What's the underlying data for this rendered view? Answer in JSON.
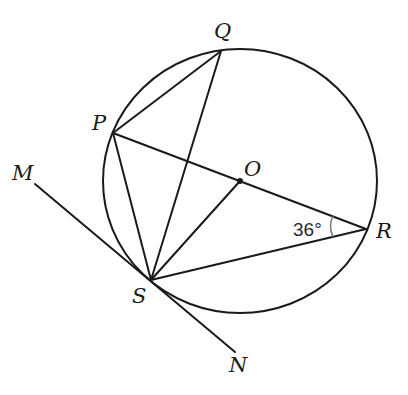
{
  "diagram": {
    "type": "circle-geometry",
    "circle": {
      "center_label": "O",
      "cx": 240,
      "cy": 181,
      "rx": 137,
      "ry": 132
    },
    "points": {
      "Q": {
        "label": "Q",
        "x": 221,
        "y": 51
      },
      "P": {
        "label": "P",
        "x": 113,
        "y": 133
      },
      "O": {
        "label": "O",
        "x": 240,
        "y": 181
      },
      "R": {
        "label": "R",
        "x": 366,
        "y": 229
      },
      "S": {
        "label": "S",
        "x": 151,
        "y": 280
      },
      "M": {
        "label": "M",
        "x": 35,
        "y": 184
      },
      "N": {
        "label": "N",
        "x": 235,
        "y": 352
      }
    },
    "segments": [
      "PQ",
      "QS",
      "PR",
      "PS",
      "OS",
      "SR",
      "MN"
    ],
    "tangent_line": {
      "from": "M",
      "to": "N",
      "touches": "S"
    },
    "angle": {
      "vertex": "R",
      "between": [
        "PR",
        "SR"
      ],
      "value": "36°"
    }
  }
}
